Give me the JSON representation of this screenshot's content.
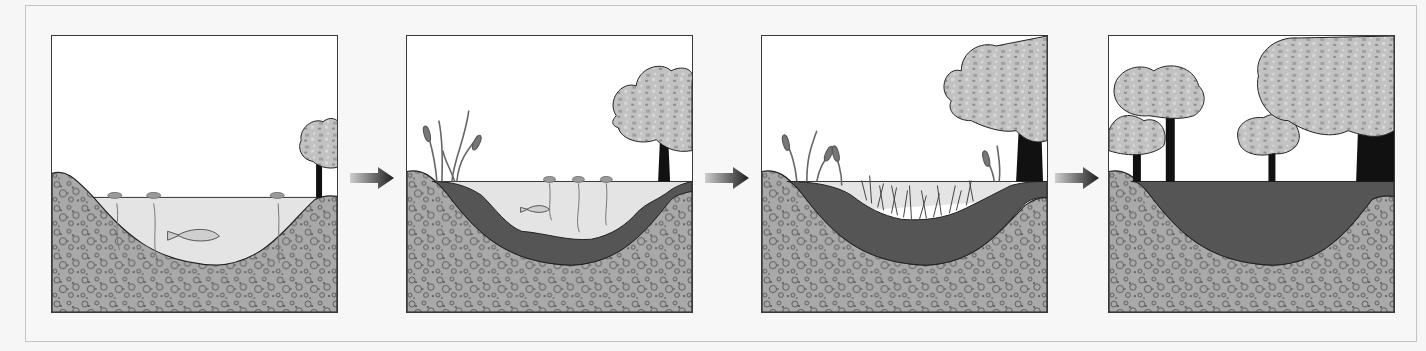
{
  "figure": {
    "type": "diagram",
    "stages": [
      {
        "index": 1,
        "name": "open-pond",
        "elements": [
          "rocky-substrate",
          "open-water",
          "fish",
          "floating-lily-pads",
          "single-small-tree"
        ]
      },
      {
        "index": 2,
        "name": "sediment-accumulation",
        "elements": [
          "rocky-substrate",
          "sediment-layer",
          "shallower-water",
          "small-fish",
          "lily-pads",
          "cattails",
          "larger-tree"
        ]
      },
      {
        "index": 3,
        "name": "marsh",
        "elements": [
          "rocky-substrate",
          "thick-sediment",
          "marsh-grasses",
          "cattails",
          "large-tree"
        ]
      },
      {
        "index": 4,
        "name": "forest",
        "elements": [
          "rocky-substrate",
          "filled-soil",
          "multiple-trees"
        ]
      }
    ],
    "arrows": 3,
    "colors": {
      "frame_border": "#c4c4c4",
      "panel_border": "#3a3a3a",
      "sky": "#ffffff",
      "water": "#e6e6e6",
      "rock_fill": "#a9a9a9",
      "sediment": "#555555",
      "foliage": "#bdbdbd",
      "trunk": "#111111",
      "arrow": "#444444"
    }
  }
}
